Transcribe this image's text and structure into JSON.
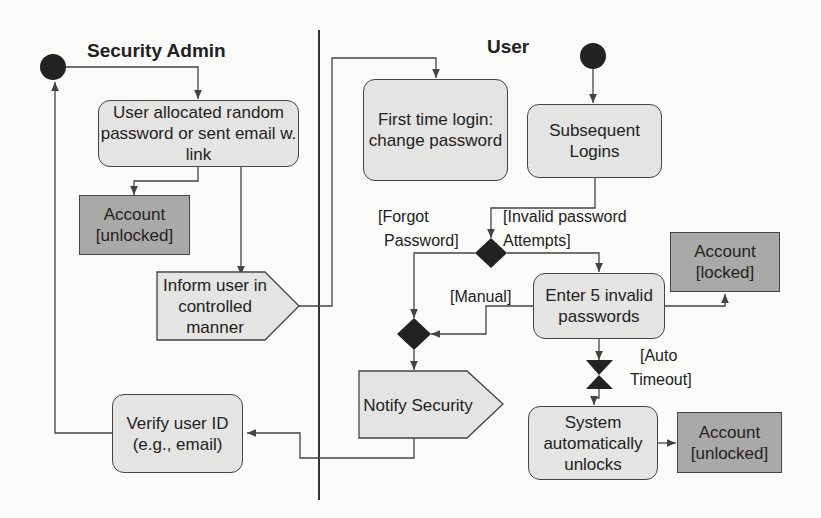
{
  "lanes": {
    "security_admin": "Security Admin",
    "user": "User"
  },
  "nodes": {
    "allocate": "User allocated random password or sent email w. link",
    "account_unlocked_admin": "Account [unlocked]",
    "inform_user": "Inform user in controlled manner",
    "verify_user": "Verify user ID (e.g., email)",
    "first_login": "First time login: change password",
    "subsequent_logins": "Subsequent Logins",
    "enter_invalid": "Enter 5 invalid passwords",
    "account_locked": "Account [locked]",
    "notify_security": "Notify Security",
    "system_unlocks": "System automatically unlocks",
    "account_unlocked_user": "Account [unlocked]"
  },
  "guards": {
    "forgot_1": "[Forgot",
    "forgot_2": "Password]",
    "invalid_1": "[Invalid password",
    "invalid_2": "Attempts]",
    "manual": "[Manual]",
    "auto_1": "[Auto",
    "auto_2": "Timeout]"
  },
  "colors": {
    "activity_fill": "#e4e4e2",
    "object_fill": "#a9a9a7",
    "line": "#444444",
    "node_fill": "#222222"
  }
}
